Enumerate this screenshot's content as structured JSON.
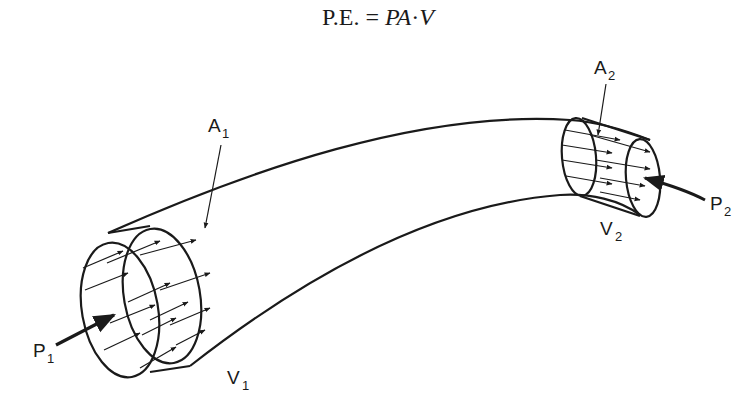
{
  "equation": {
    "lhs": "P.E.",
    "equals": "=",
    "rhs_p": "P",
    "rhs_a": "A",
    "rhs_dot": "·",
    "rhs_v": "V"
  },
  "labels": {
    "a1": {
      "main": "A",
      "sub": "1"
    },
    "a2": {
      "main": "A",
      "sub": "2"
    },
    "p1": {
      "main": "P",
      "sub": "1"
    },
    "p2": {
      "main": "P",
      "sub": "2"
    },
    "v1": {
      "main": "V",
      "sub": "1"
    },
    "v2": {
      "main": "V",
      "sub": "2"
    }
  },
  "colors": {
    "ink": "#1a1a1a",
    "background": "#ffffff"
  }
}
